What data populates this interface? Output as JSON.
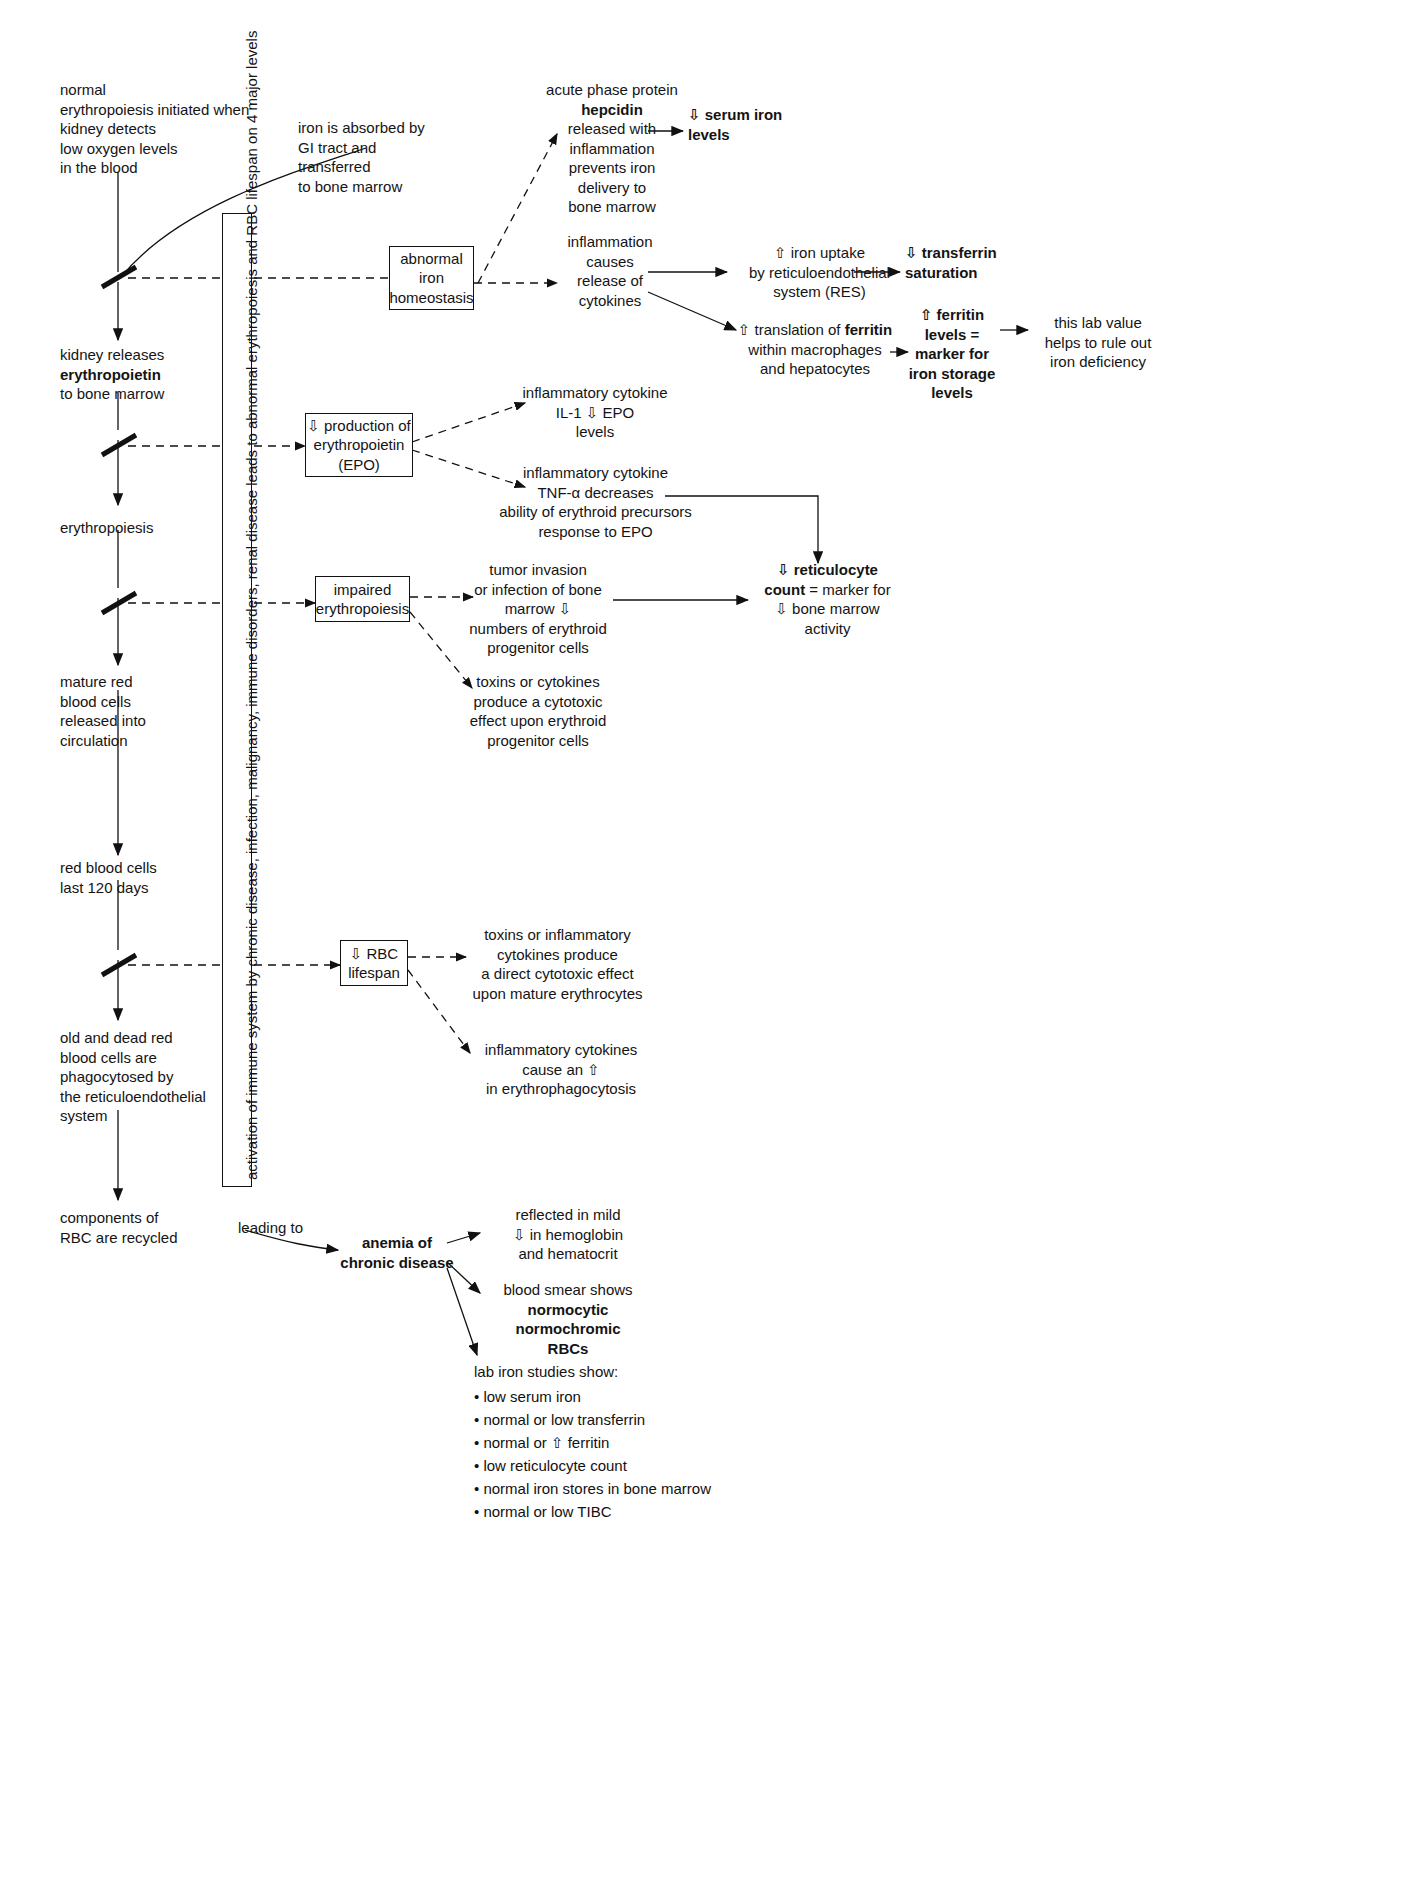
{
  "diagram": {
    "vertical_label": "activation of immune system by chronic disease, infection, malignancy, immune disorders, renal disease leads to abnormal erythropoiesis and RBC lifespan on 4 major levels",
    "colors": {
      "ink": "#111111",
      "background": "#ffffff"
    }
  },
  "left_chain": [
    {
      "id": "n1",
      "text": "normal\nerythropoiesis initiated when\nkidney detects\nlow oxygen levels\nin the blood"
    },
    {
      "id": "n2",
      "text": "kidney releases\nerythropoietin\nto bone marrow",
      "bold_line": "erythropoietin"
    },
    {
      "id": "n3",
      "text": "erythropoiesis"
    },
    {
      "id": "n4",
      "text": "mature red\nblood cells\nreleased into\ncirculation"
    },
    {
      "id": "n5",
      "text": "red blood cells\nlast 120 days"
    },
    {
      "id": "n6",
      "text": "old and dead red\nblood cells are\nphagocytosed by\nthe reticuloendothelial\nsystem"
    },
    {
      "id": "n7",
      "text": "components of\nRBC are recycled"
    }
  ],
  "iron_absorption": {
    "text": "iron is absorbed by\nGI tract and\ntransferred\nto bone marrow"
  },
  "boxes": [
    {
      "id": "b1",
      "text": "abnormal\niron\nhomeostasis"
    },
    {
      "id": "b2",
      "text": "⇩ production of\nerythropoietin\n(EPO)"
    },
    {
      "id": "b3",
      "text": "impaired\nerythropoiesis"
    },
    {
      "id": "b4",
      "text": "⇩ RBC\nlifespan"
    }
  ],
  "iron_branch": {
    "hepcidin": {
      "line1": "acute phase protein",
      "line2": "hepcidin",
      "rest": "released with\ninflammation\nprevents iron\ndelivery to\nbone marrow"
    },
    "serum_iron": "⇩ serum iron\nlevels",
    "inflammation_cytokines": "inflammation\ncauses\nrelease of\ncytokines",
    "iron_uptake": "⇧ iron uptake\nby reticuloendothelial\nsystem (RES)",
    "transferrin_saturation": "⇩ transferrin\nsaturation",
    "ferritin_translation": {
      "line1_pre": "⇧ translation of ",
      "line1_bold": "ferritin",
      "rest": "within macrophages\nand hepatocytes"
    },
    "ferritin_levels": "⇧ ferritin\nlevels =\nmarker for\niron storage\nlevels",
    "lab_value_note": "this lab value\nhelps to rule out\niron deficiency"
  },
  "epo_branch": {
    "il1": "inflammatory cytokine\nIL-1 ⇩ EPO\nlevels",
    "tnf": "inflammatory cytokine\nTNF-α decreases\nability of erythroid precursors\nresponse to EPO"
  },
  "erythropoiesis_branch": {
    "tumor": "tumor invasion\nor infection of bone\nmarrow ⇩\nnumbers of erythroid\nprogenitor cells",
    "toxins": "toxins or cytokines\nproduce a cytotoxic\neffect upon erythroid\nprogenitor cells",
    "reticulocyte": {
      "line1": "⇩ reticulocyte",
      "line2_bold": "count",
      "line2_rest": " = marker for",
      "line3": "⇩ bone marrow",
      "line4": "activity"
    }
  },
  "rbc_lifespan_branch": {
    "toxins": "toxins or inflammatory\ncytokines produce\na direct cytotoxic effect\nupon mature erythrocytes",
    "phagocytosis": "inflammatory cytokines\ncause an ⇧\nin erythrophagocytosis"
  },
  "outcome": {
    "leading_to": "leading to",
    "title": "anemia of\nchronic disease",
    "mild": "reflected in mild\n⇩ in hemoglobin\nand hematocrit",
    "smear_pre": "blood smear shows",
    "smear_bold": "normocytic\nnormochromic\nRBCs",
    "lab_heading": "lab iron studies show:",
    "lab_items": [
      "• low serum iron",
      "• normal or low transferrin",
      "• normal or ⇧ ferritin",
      "• low reticulocyte count",
      "• normal iron stores in bone marrow",
      "• normal or low TIBC"
    ]
  }
}
